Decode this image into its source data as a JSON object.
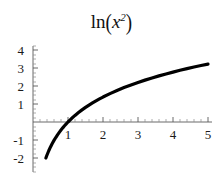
{
  "chart_data": {
    "type": "line",
    "title_parts": {
      "function": "ln",
      "open_paren": "(",
      "variable": "x",
      "exponent": "2",
      "close_paren": ")"
    },
    "xlabel": "",
    "ylabel": "",
    "xlim": [
      0.32,
      5.15
    ],
    "ylim": [
      -2.15,
      4.1
    ],
    "xticks": [
      1,
      2,
      3,
      4,
      5
    ],
    "xtick_labels": [
      "1",
      "2",
      "3",
      "4",
      "5"
    ],
    "yticks": [
      -2,
      -1,
      1,
      2,
      3,
      4
    ],
    "ytick_labels": [
      "-2",
      "-1",
      "1",
      "2",
      "3",
      "4"
    ],
    "minor_ticks": true,
    "grid": false,
    "legend": null,
    "axes_style": "crossed-at-origin",
    "line_color": "#000000",
    "line_width": 3.2,
    "axis_color": "#555555",
    "background": "#ffffff",
    "series": [
      {
        "name": "ln(x^2)",
        "x": [
          0.368,
          0.4,
          0.45,
          0.5,
          0.55,
          0.6,
          0.65,
          0.7,
          0.75,
          0.8,
          0.85,
          0.9,
          0.95,
          1.0,
          1.1,
          1.2,
          1.3,
          1.4,
          1.5,
          1.6,
          1.7,
          1.8,
          1.9,
          2.0,
          2.2,
          2.4,
          2.6,
          2.8,
          3.0,
          3.2,
          3.4,
          3.6,
          3.8,
          4.0,
          4.2,
          4.4,
          4.6,
          4.8,
          5.0
        ],
        "y": [
          -2.0,
          -1.833,
          -1.597,
          -1.386,
          -1.196,
          -1.022,
          -0.862,
          -0.713,
          -0.575,
          -0.446,
          -0.325,
          -0.211,
          -0.103,
          0.0,
          0.191,
          0.365,
          0.525,
          0.673,
          0.811,
          0.94,
          1.062,
          1.176,
          1.285,
          1.386,
          1.577,
          1.751,
          1.911,
          2.059,
          2.197,
          2.326,
          2.448,
          2.562,
          2.67,
          2.773,
          2.871,
          2.964,
          3.053,
          3.138,
          3.219
        ]
      }
    ]
  },
  "axes_geometry": {
    "origin_x_px": 33,
    "origin_y_px": 122,
    "x_scale_px_per_unit": 35,
    "y_scale_px_per_unit": 18
  }
}
